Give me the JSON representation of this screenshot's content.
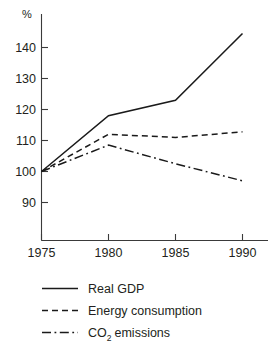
{
  "chart_data": {
    "type": "line",
    "title": "",
    "subtitle": "",
    "xlabel": "",
    "ylabel": "%",
    "unit_label": "%",
    "x": [
      1975,
      1980,
      1985,
      1990
    ],
    "xtick_labels": [
      "1975",
      "1980",
      "1985",
      "1990"
    ],
    "ytick_labels": [
      "140",
      "130",
      "120",
      "110",
      "100",
      "90"
    ],
    "yticks": [
      140,
      130,
      120,
      110,
      100,
      90
    ],
    "xlim": [
      1975,
      1990
    ],
    "ylim": [
      85,
      148
    ],
    "grid": false,
    "legend_position": "bottom-left",
    "series": [
      {
        "name": "Real GDP",
        "style": "solid",
        "color": "#1a1a1a",
        "values": [
          100,
          118,
          123,
          144.5
        ]
      },
      {
        "name": "Energy consumption",
        "style": "dashed",
        "color": "#1a1a1a",
        "values": [
          100,
          112,
          111,
          112.8
        ]
      },
      {
        "name": "CO2 emissions",
        "name_prefix": "CO",
        "name_subscript": "2",
        "name_suffix": " emissions",
        "style": "dashdot",
        "color": "#1a1a1a",
        "values": [
          100,
          108.5,
          102.5,
          97
        ]
      }
    ]
  },
  "axes": {
    "y_unit": "%",
    "y_labels": {
      "t140": "140",
      "t130": "130",
      "t120": "120",
      "t110": "110",
      "t100": "100",
      "t90": "90"
    },
    "x_labels": {
      "t1975": "1975",
      "t1980": "1980",
      "t1985": "1985",
      "t1990": "1990"
    }
  },
  "legend": {
    "items": {
      "gdp": "Real GDP",
      "energy": "Energy consumption",
      "co2_prefix": "CO",
      "co2_sub": "2",
      "co2_suffix": "emissions"
    }
  }
}
